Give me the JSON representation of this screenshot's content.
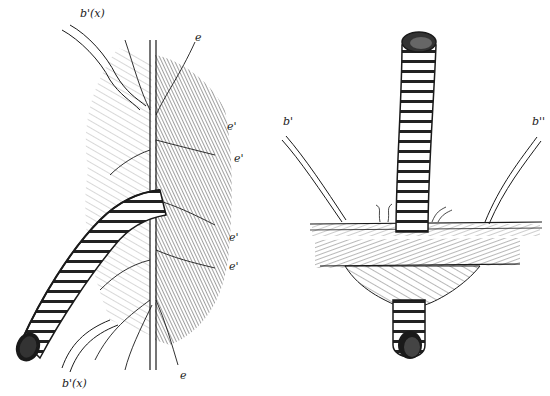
{
  "figure": {
    "left_panel": {
      "description": "Worm burrow tube emerging through matted fibrous tissue with branching central vessel",
      "labels": [
        {
          "id": "b_x_top",
          "text": "b'(x)",
          "x": 83,
          "y": 10
        },
        {
          "id": "e_top",
          "text": "e",
          "x": 195,
          "y": 36
        },
        {
          "id": "e1",
          "text": "e'",
          "x": 228,
          "y": 125
        },
        {
          "id": "e2",
          "text": "e'",
          "x": 235,
          "y": 157
        },
        {
          "id": "e3",
          "text": "e'",
          "x": 230,
          "y": 236
        },
        {
          "id": "e4",
          "text": "e'",
          "x": 230,
          "y": 265
        },
        {
          "id": "b_x_bottom",
          "text": "b'(x)",
          "x": 62,
          "y": 378
        },
        {
          "id": "e_bottom",
          "text": "e",
          "x": 180,
          "y": 372
        }
      ]
    },
    "right_panel": {
      "description": "Segmented tube passing vertically through a horizontal membrane layer with funnel-shaped sheath below",
      "labels": [
        {
          "id": "b_prime",
          "text": "b'",
          "x": 283,
          "y": 120
        },
        {
          "id": "b_double_prime",
          "text": "b''",
          "x": 533,
          "y": 120
        }
      ]
    },
    "colors": {
      "ink": "#1a1a1a",
      "paper": "#ffffff",
      "shade": "#555555"
    }
  }
}
